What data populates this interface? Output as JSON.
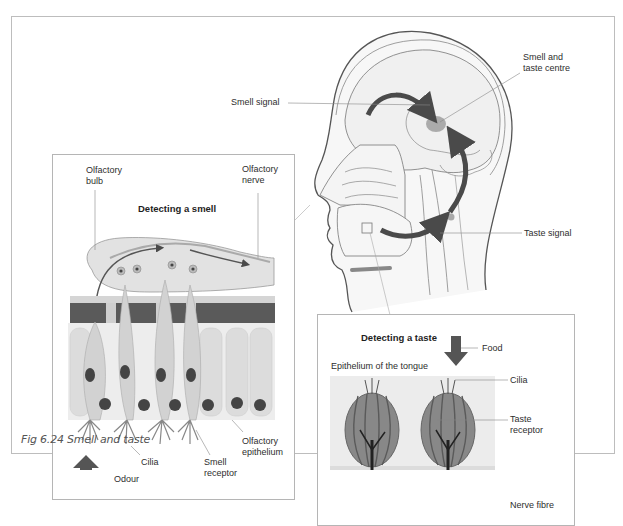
{
  "figure": {
    "caption": "Fig 6.24 Smell and taste",
    "palette": {
      "frame_border": "#bdbdbd",
      "line": "#777777",
      "arrow": "#4a4a4a",
      "tissue_dark": "#5a5a5a",
      "tissue_light": "#e6e6e6",
      "centre_spot": "#9a9a9a"
    }
  },
  "head": {
    "labels": {
      "smell_signal": "Smell signal",
      "smell_taste_centre": "Smell and\ntaste centre",
      "taste_signal": "Taste signal"
    }
  },
  "smell_panel": {
    "title": "Detecting a smell",
    "labels": {
      "olfactory_bulb": "Olfactory\nbulb",
      "olfactory_nerve": "Olfactory\nnerve",
      "cilia": "Cilia",
      "odour": "Odour",
      "smell_receptor": "Smell\nreceptor",
      "olfactory_epithelium": "Olfactory\nepithelium"
    }
  },
  "taste_panel": {
    "title": "Detecting a taste",
    "labels": {
      "food": "Food",
      "epithelium_of_tongue": "Epithelium of the tongue",
      "cilia": "Cilia",
      "taste_receptor": "Taste\nreceptor",
      "nerve_fibre": "Nerve fibre"
    }
  }
}
